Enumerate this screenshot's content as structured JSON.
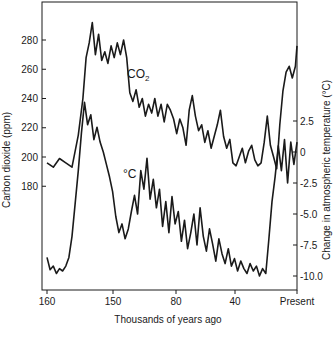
{
  "chart_data": {
    "type": "line",
    "title": "",
    "xlabel": "Thousands of years ago",
    "ylabel_left": "Carbon dioxide (ppm)",
    "ylabel_right": "Change in atmospheric temperature (°C)",
    "x_ticks": [
      "160",
      "150",
      "80",
      "40",
      "Present"
    ],
    "y_left_ticks": [
      "180",
      "200",
      "220",
      "240",
      "260",
      "280"
    ],
    "y_right_ticks": [
      "2.5",
      "0",
      "-2.5",
      "-5.0",
      "-7.5",
      "-10.0"
    ],
    "xlim": [
      160,
      0
    ],
    "ylim_left": [
      170,
      290
    ],
    "ylim_right": [
      -11,
      4
    ],
    "grid": false,
    "annotations": [
      {
        "text": "CO2",
        "near": "CO2 series at ~125 kyr"
      },
      {
        "text": "°C",
        "near": "temperature series at ~125 kyr"
      }
    ],
    "series": [
      {
        "name": "CO2",
        "axis": "left",
        "unit": "ppm",
        "x": [
          160,
          156,
          152,
          148,
          144,
          140,
          137,
          135,
          133,
          131,
          129,
          127,
          125,
          123,
          121,
          119,
          117,
          115,
          113,
          111,
          109,
          107,
          105,
          103,
          101,
          99,
          97,
          95,
          93,
          91,
          89,
          87,
          85,
          83,
          81,
          79,
          77,
          75,
          73,
          71,
          69,
          67,
          65,
          63,
          61,
          59,
          57,
          55,
          53,
          51,
          49,
          47,
          45,
          43,
          41,
          39,
          37,
          35,
          33,
          31,
          29,
          27,
          25,
          23,
          21,
          19,
          17,
          15,
          13,
          11,
          9,
          7,
          5,
          3,
          1,
          0
        ],
        "values": [
          196,
          193,
          199,
          196,
          193,
          215,
          240,
          268,
          278,
          292,
          270,
          284,
          266,
          272,
          264,
          276,
          268,
          278,
          270,
          280,
          268,
          244,
          238,
          246,
          234,
          240,
          228,
          236,
          230,
          240,
          228,
          236,
          224,
          236,
          232,
          226,
          216,
          226,
          220,
          208,
          232,
          242,
          228,
          218,
          222,
          210,
          218,
          206,
          214,
          222,
          232,
          214,
          206,
          212,
          196,
          194,
          200,
          206,
          196,
          204,
          208,
          198,
          194,
          196,
          210,
          228,
          208,
          200,
          192,
          222,
          245,
          258,
          262,
          254,
          262,
          276
        ]
      },
      {
        "name": "Temperature change",
        "axis": "right",
        "unit": "°C",
        "x": [
          160,
          158,
          156,
          154,
          152,
          150,
          148,
          146,
          144,
          142,
          140,
          138,
          136,
          134,
          132,
          130,
          128,
          126,
          124,
          122,
          120,
          118,
          116,
          114,
          112,
          110,
          108,
          106,
          104,
          102,
          100,
          98,
          96,
          94,
          92,
          90,
          88,
          86,
          84,
          82,
          80,
          78,
          76,
          74,
          72,
          70,
          68,
          66,
          64,
          62,
          60,
          58,
          56,
          54,
          52,
          50,
          48,
          46,
          44,
          42,
          40,
          38,
          36,
          34,
          32,
          30,
          28,
          26,
          24,
          22,
          20,
          18,
          16,
          14,
          12,
          10,
          8,
          6,
          4,
          2,
          0
        ],
        "values": [
          -8.5,
          -9.5,
          -9.2,
          -9.8,
          -9.4,
          -9.6,
          -9.2,
          -8.5,
          -6.8,
          -4.2,
          -1.5,
          1.5,
          4.0,
          2.2,
          3.0,
          1.0,
          2.0,
          0.8,
          0.0,
          -1.0,
          -2.0,
          -3.2,
          -5.2,
          -6.5,
          -5.8,
          -7.0,
          -6.2,
          -4.8,
          -3.5,
          -5.0,
          -1.5,
          -3.0,
          -0.5,
          -3.8,
          -2.2,
          -4.5,
          -3.0,
          -6.0,
          -4.0,
          -6.5,
          -3.6,
          -5.8,
          -4.8,
          -7.2,
          -5.5,
          -7.8,
          -6.5,
          -5.0,
          -7.5,
          -4.5,
          -6.8,
          -8.0,
          -6.2,
          -7.4,
          -8.8,
          -7.0,
          -8.2,
          -9.0,
          -7.8,
          -9.2,
          -8.6,
          -9.6,
          -8.8,
          -9.4,
          -9.8,
          -9.0,
          -9.6,
          -9.2,
          -10.0,
          -9.4,
          -9.8,
          -7.0,
          -4.0,
          -2.0,
          0.5,
          -1.5,
          1.0,
          -2.5,
          0.8,
          -1.0,
          0.8
        ]
      }
    ]
  }
}
